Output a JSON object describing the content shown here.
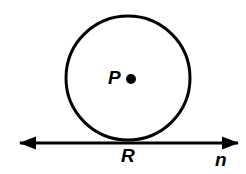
{
  "figure": {
    "kind": "geometry-diagram",
    "background_color": "#ffffff",
    "stroke_color": "#000000",
    "canvas": {
      "width": 246,
      "height": 174
    },
    "circle": {
      "name": "circle-P",
      "center_x": 128,
      "center_y": 78,
      "radius": 62,
      "stroke_width": 3,
      "fill": "none"
    },
    "center_point": {
      "name": "point-P",
      "x": 131,
      "y": 79,
      "radius": 5,
      "fill": "#000000"
    },
    "tangent_line": {
      "name": "line-n",
      "y": 143,
      "x_start": 20,
      "x_end": 238,
      "stroke_width": 3,
      "arrow_left": true,
      "arrow_right": true,
      "arrow_head_length": 16,
      "arrow_head_width": 13
    },
    "tangent_point": {
      "name": "point-R",
      "x": 128,
      "y": 143
    },
    "labels": {
      "center": "P",
      "tangent_point": "R",
      "line": "n"
    }
  }
}
